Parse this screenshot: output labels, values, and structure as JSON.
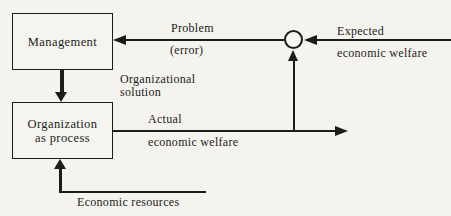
{
  "diagram": {
    "colors": {
      "background": "#f5f3ee",
      "ink": "#1c1c1c"
    },
    "nodes": {
      "management": {
        "label": "Management"
      },
      "organization": {
        "label_line1": "Organization",
        "label_line2": "as process"
      }
    },
    "comparator": {
      "icon": "comparator-circle",
      "shape": "open circle summing junction"
    },
    "labels": {
      "problem_line1": "Problem",
      "problem_line2": "(error)",
      "expected_line1": "Expected",
      "expected_line2": "economic welfare",
      "organizational_line1": "Organizational",
      "organizational_line2": "solution",
      "actual_line1": "Actual",
      "actual_line2": "economic welfare",
      "economic_resources": "Economic resources"
    },
    "connections": [
      {
        "from": "comparator",
        "to": "management",
        "label": "Problem (error)",
        "direction": "left"
      },
      {
        "from": "right-edge",
        "to": "comparator",
        "label": "Expected economic welfare",
        "direction": "left"
      },
      {
        "from": "management",
        "to": "organization",
        "label": "Organizational solution",
        "direction": "down"
      },
      {
        "from": "organization",
        "to": "right",
        "label": "Actual economic welfare",
        "direction": "right",
        "branch": "up into comparator"
      },
      {
        "from": "bottom-right",
        "to": "organization",
        "label": "Economic resources",
        "direction": "up"
      }
    ]
  }
}
